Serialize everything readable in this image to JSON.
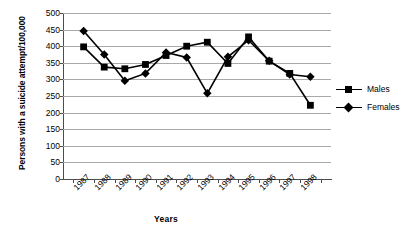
{
  "chart_data": {
    "type": "line",
    "title": "",
    "xlabel": "Years",
    "ylabel": "Persons with a suicide attempt/100,000",
    "categories": [
      "1987",
      "1988",
      "1989",
      "1990",
      "1991",
      "1992",
      "1993",
      "1994",
      "1995",
      "1996",
      "1997",
      "1998"
    ],
    "ylim": [
      0,
      500
    ],
    "ytick_step": 50,
    "yticks": [
      "500",
      "450",
      "400",
      "350",
      "300",
      "250",
      "200",
      "150",
      "100",
      "50",
      "0"
    ],
    "grid": "horizontal",
    "legend_position": "right",
    "series": [
      {
        "name": "Males",
        "marker": "square",
        "color": "#000000",
        "values": [
          398,
          337,
          332,
          345,
          372,
          400,
          412,
          348,
          428,
          355,
          318,
          222
        ]
      },
      {
        "name": "Females",
        "marker": "diamond",
        "color": "#000000",
        "values": [
          446,
          375,
          296,
          318,
          381,
          366,
          258,
          368,
          418,
          356,
          315,
          308
        ]
      }
    ]
  }
}
